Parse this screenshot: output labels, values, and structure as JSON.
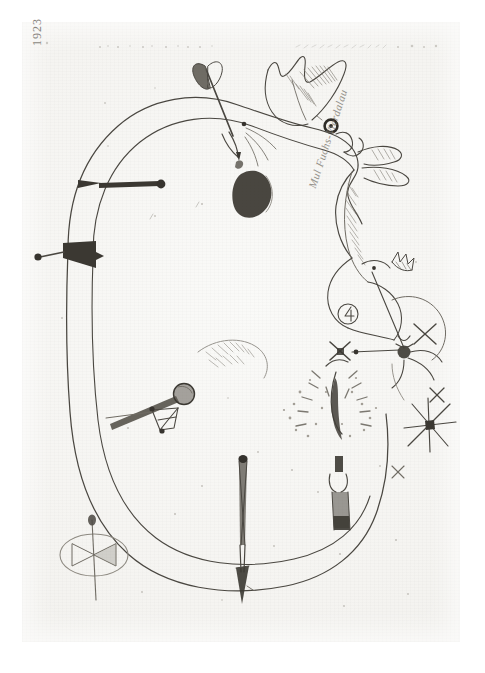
{
  "artwork": {
    "medium_appearance": "pencil and ink drawing on aged laid paper",
    "plate_background_hex": "#f5f4f1",
    "ink_hex": "#4a4741",
    "solid_fill_hex": "#3b3832",
    "inscriptions": {
      "top_left_year": "1923",
      "center_right_signature": "Mul Fuchs-Vierdalau"
    },
    "elements": {
      "body_contour": "large double-outlined organic closed form filling the plate",
      "arrow_top_center": "fletched arrow piercing the upper contour, pointing down-right",
      "crest_tail": "hatched fish-tail / bird-crest form at top right",
      "eye_node": "dark ringed circular eye on the right contour",
      "dark_seed": "solid shaded teardrop blob at center-left of the head",
      "left_dart_upper": "horizontal dart with round knob, left flank",
      "left_dart_lower": "solid triangular arrowhead dart, left flank",
      "ball_on_stick": "sphere on a shaft with small wire basket beneath",
      "needle_left": "tall vertical needle with dark round head",
      "needle_right": "tall vertical pin wrapped with a ring collar",
      "arrow_bottom": "downward arrow piercing the lower contour",
      "spray_burst": "fan of dashes and dots radiating from a dark stem",
      "star_burst_right": "six-rayed asterisk with dark centre node",
      "x_mark_right": "small X cross mark",
      "circled_four": "circled numeral-like glyph in the right cluster",
      "seal_oval": "oval stamp containing a bowtie motif, pierced by a pin",
      "dotted_rule_top": "faint broken dotted rule along the top margin"
    }
  }
}
